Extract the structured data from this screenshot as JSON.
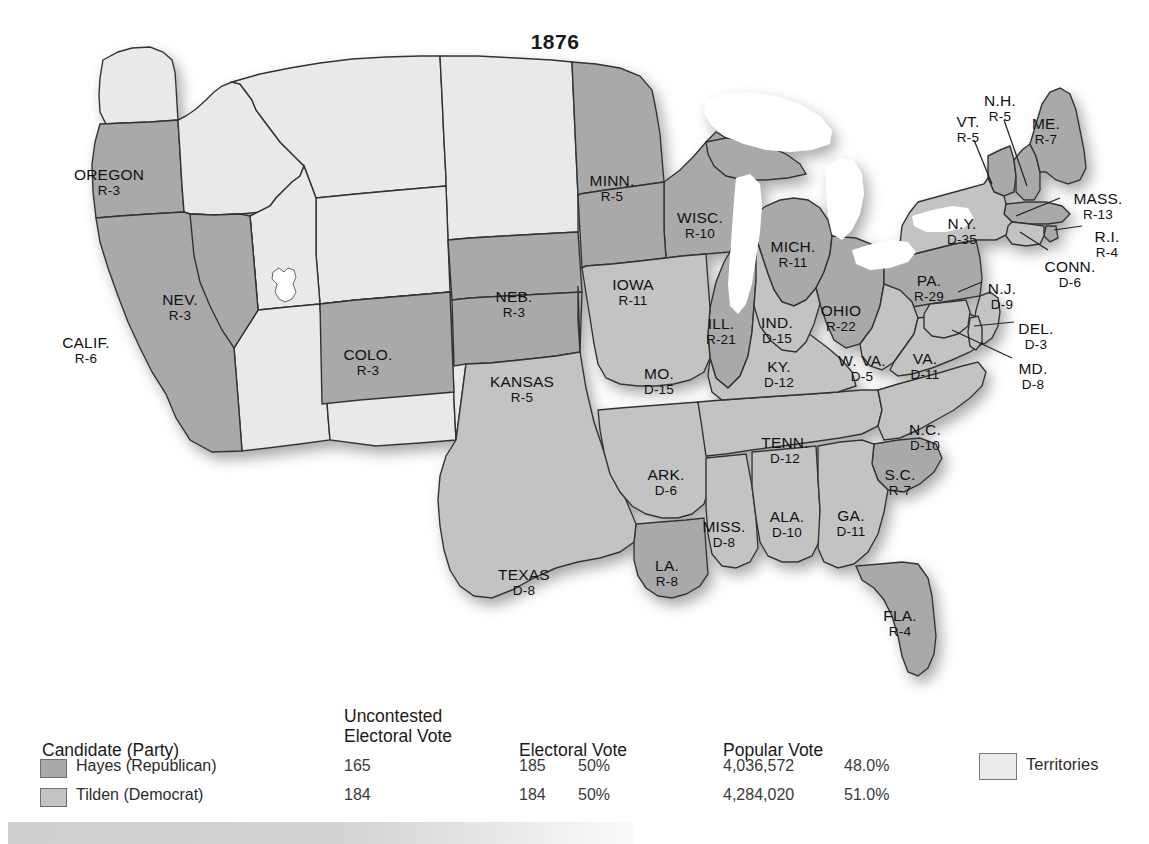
{
  "title": "1876",
  "map": {
    "alt": "1876 United States presidential election electoral map",
    "colors": {
      "republican": "#a9a9a9",
      "democrat": "#c3c3c3",
      "territory": "#e9e9e9",
      "water": "#ffffff",
      "border": "#333333",
      "text": "#111111"
    },
    "states": [
      {
        "code": "OREGON",
        "name": "OREGON",
        "result": "R-3",
        "party": "R",
        "ev": 3,
        "x": 109,
        "y": 166,
        "big": true
      },
      {
        "code": "CALIF.",
        "name": "CALIF.",
        "result": "R-6",
        "party": "R",
        "ev": 6,
        "x": 86,
        "y": 334,
        "big": true
      },
      {
        "code": "NEV.",
        "name": "NEV.",
        "result": "R-3",
        "party": "R",
        "ev": 3,
        "x": 180,
        "y": 291,
        "big": true
      },
      {
        "code": "COLO.",
        "name": "COLO.",
        "result": "R-3",
        "party": "R",
        "ev": 3,
        "x": 368,
        "y": 346,
        "big": true
      },
      {
        "code": "NEB.",
        "name": "NEB.",
        "result": "R-3",
        "party": "R",
        "ev": 3,
        "x": 514,
        "y": 288,
        "big": true
      },
      {
        "code": "KANSAS",
        "name": "KANSAS",
        "result": "R-5",
        "party": "R",
        "ev": 5,
        "x": 522,
        "y": 373,
        "big": true
      },
      {
        "code": "MINN.",
        "name": "MINN.",
        "result": "R-5",
        "party": "R",
        "ev": 5,
        "x": 612,
        "y": 172,
        "big": true
      },
      {
        "code": "WISC.",
        "name": "WISC.",
        "result": "R-10",
        "party": "R",
        "ev": 10,
        "x": 700,
        "y": 209,
        "big": true
      },
      {
        "code": "IOWA",
        "name": "IOWA",
        "result": "R-11",
        "party": "R",
        "ev": 11,
        "x": 633,
        "y": 276,
        "big": true
      },
      {
        "code": "MICH.",
        "name": "MICH.",
        "result": "R-11",
        "party": "R",
        "ev": 11,
        "x": 793,
        "y": 238,
        "big": true
      },
      {
        "code": "ILL.",
        "name": "ILL.",
        "result": "R-21",
        "party": "R",
        "ev": 21,
        "x": 721,
        "y": 315,
        "big": true
      },
      {
        "code": "IND.",
        "name": "IND.",
        "result": "D-15",
        "party": "D",
        "ev": 15,
        "x": 777,
        "y": 314,
        "big": true
      },
      {
        "code": "OHIO",
        "name": "OHIO",
        "result": "R-22",
        "party": "R",
        "ev": 22,
        "x": 841,
        "y": 302,
        "big": true
      },
      {
        "code": "MO.",
        "name": "MO.",
        "result": "D-15",
        "party": "D",
        "ev": 15,
        "x": 659,
        "y": 365,
        "big": true
      },
      {
        "code": "ARK.",
        "name": "ARK.",
        "result": "D-6",
        "party": "D",
        "ev": 6,
        "x": 666,
        "y": 466,
        "big": true
      },
      {
        "code": "LA.",
        "name": "LA.",
        "result": "R-8",
        "party": "R",
        "ev": 8,
        "x": 667,
        "y": 557,
        "big": true
      },
      {
        "code": "MISS.",
        "name": "MISS.",
        "result": "D-8",
        "party": "D",
        "ev": 8,
        "x": 724,
        "y": 518,
        "big": true
      },
      {
        "code": "ALA.",
        "name": "ALA.",
        "result": "D-10",
        "party": "D",
        "ev": 10,
        "x": 787,
        "y": 508,
        "big": true
      },
      {
        "code": "GA.",
        "name": "GA.",
        "result": "D-11",
        "party": "D",
        "ev": 11,
        "x": 851,
        "y": 507,
        "big": true
      },
      {
        "code": "FLA.",
        "name": "FLA.",
        "result": "R-4",
        "party": "R",
        "ev": 4,
        "x": 900,
        "y": 607,
        "big": true
      },
      {
        "code": "S.C.",
        "name": "S.C.",
        "result": "R-7",
        "party": "R",
        "ev": 7,
        "x": 900,
        "y": 466,
        "big": true
      },
      {
        "code": "N.C.",
        "name": "N.C.",
        "result": "D-10",
        "party": "D",
        "ev": 10,
        "x": 925,
        "y": 421,
        "big": true
      },
      {
        "code": "TENN.",
        "name": "TENN.",
        "result": "D-12",
        "party": "D",
        "ev": 12,
        "x": 785,
        "y": 434,
        "big": true
      },
      {
        "code": "KY.",
        "name": "KY.",
        "result": "D-12",
        "party": "D",
        "ev": 12,
        "x": 779,
        "y": 358,
        "big": true
      },
      {
        "code": "W. VA.",
        "name": "W. VA.",
        "result": "D-5",
        "party": "D",
        "ev": 5,
        "x": 862,
        "y": 352,
        "big": true
      },
      {
        "code": "VA.",
        "name": "VA.",
        "result": "D-11",
        "party": "D",
        "ev": 11,
        "x": 925,
        "y": 350,
        "big": true
      },
      {
        "code": "TEXAS",
        "name": "TEXAS",
        "result": "D-8",
        "party": "D",
        "ev": 8,
        "x": 524,
        "y": 566,
        "big": true
      },
      {
        "code": "PA.",
        "name": "PA.",
        "result": "R-29",
        "party": "R",
        "ev": 29,
        "x": 929,
        "y": 272,
        "big": true
      },
      {
        "code": "N.Y.",
        "name": "N.Y.",
        "result": "D-35",
        "party": "D",
        "ev": 35,
        "x": 962,
        "y": 215,
        "big": true
      },
      {
        "code": "VT.",
        "name": "VT.",
        "result": "R-5",
        "party": "R",
        "ev": 5,
        "x": 968,
        "y": 113,
        "big": true
      },
      {
        "code": "N.H.",
        "name": "N.H.",
        "result": "R-5",
        "party": "R",
        "ev": 5,
        "x": 1000,
        "y": 92,
        "big": true
      },
      {
        "code": "ME.",
        "name": "ME.",
        "result": "R-7",
        "party": "R",
        "ev": 7,
        "x": 1046,
        "y": 115,
        "big": true
      },
      {
        "code": "MASS.",
        "name": "MASS.",
        "result": "R-13",
        "party": "R",
        "ev": 13,
        "x": 1098,
        "y": 190,
        "big": true
      },
      {
        "code": "R.I.",
        "name": "R.I.",
        "result": "R-4",
        "party": "R",
        "ev": 4,
        "x": 1107,
        "y": 228,
        "big": true
      },
      {
        "code": "CONN.",
        "name": "CONN.",
        "result": "D-6",
        "party": "D",
        "ev": 6,
        "x": 1070,
        "y": 258,
        "big": true
      },
      {
        "code": "N.J.",
        "name": "N.J.",
        "result": "D-9",
        "party": "D",
        "ev": 9,
        "x": 1002,
        "y": 280,
        "big": true
      },
      {
        "code": "DEL.",
        "name": "DEL.",
        "result": "D-3",
        "party": "D",
        "ev": 3,
        "x": 1036,
        "y": 320,
        "big": true
      },
      {
        "code": "MD.",
        "name": "MD.",
        "result": "D-8",
        "party": "D",
        "ev": 8,
        "x": 1033,
        "y": 360,
        "big": true
      }
    ]
  },
  "legend": {
    "headers": {
      "candidate": "Candidate (Party)",
      "uncontested": "Uncontested\nElectoral Vote",
      "electoral": "Electoral Vote",
      "popular": "Popular Vote"
    },
    "rows": [
      {
        "swatch_color": "#a9a9a9",
        "candidate": "Hayes (Republican)",
        "uncontested_electoral_vote": "165",
        "electoral_vote": "185",
        "electoral_pct": "50%",
        "popular_vote": "4,036,572",
        "popular_pct": "48.0%"
      },
      {
        "swatch_color": "#c3c3c3",
        "candidate": "Tilden (Democrat)",
        "uncontested_electoral_vote": "184",
        "electoral_vote": "184",
        "electoral_pct": "50%",
        "popular_vote": "4,284,020",
        "popular_pct": "51.0%"
      }
    ],
    "territories_label": "Territories",
    "territories_color": "#eaeaea"
  }
}
